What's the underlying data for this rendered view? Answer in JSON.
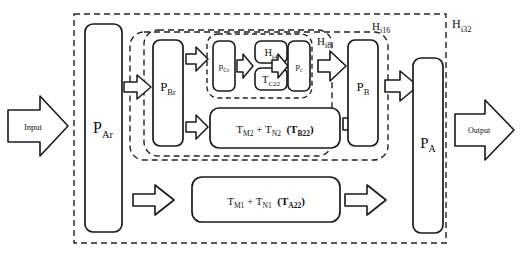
{
  "diagram": {
    "io": {
      "input_label": "Input",
      "output_label": "Output"
    },
    "groups": [
      {
        "id": "hi32",
        "label": "H",
        "sub": "i32"
      },
      {
        "id": "hi16",
        "label": "H",
        "sub": "i16"
      },
      {
        "id": "hi8",
        "label": "H",
        "sub": "i8"
      },
      {
        "id": "hi4",
        "label": "H",
        "sub": "i4"
      }
    ],
    "blocks": {
      "p_ar": {
        "base": "P",
        "sub": "Ar"
      },
      "p_br": {
        "base": "P",
        "sub": "Br"
      },
      "p_cr": {
        "base": "p",
        "sub": "Cr"
      },
      "p_c": {
        "base": "p",
        "sub": "c"
      },
      "p_b": {
        "base": "P",
        "sub": "B"
      },
      "p_a": {
        "base": "P",
        "sub": "A"
      },
      "h_i4": {
        "base": "H",
        "sub": "i4"
      },
      "t_c22": {
        "base": "T",
        "sub": "C22"
      }
    },
    "sum_rows": [
      {
        "id": "row_b22",
        "t1_base": "T",
        "t1_sub": "M2",
        "plus": "+",
        "t2_base": "T",
        "t2_sub": "N2",
        "paren_open": "(",
        "g_base": "T",
        "g_sub": "B22",
        "paren_close": ")"
      },
      {
        "id": "row_a22",
        "t1_base": "T",
        "t1_sub": "M1",
        "plus": "+",
        "t2_base": "T",
        "t2_sub": "N1",
        "paren_open": "(",
        "g_base": "T",
        "g_sub": "A22",
        "paren_close": ")"
      }
    ],
    "colors": {
      "stroke": "#1a1a1a",
      "dash": "#222222",
      "background": "#ffffff",
      "text": "#111111"
    }
  }
}
